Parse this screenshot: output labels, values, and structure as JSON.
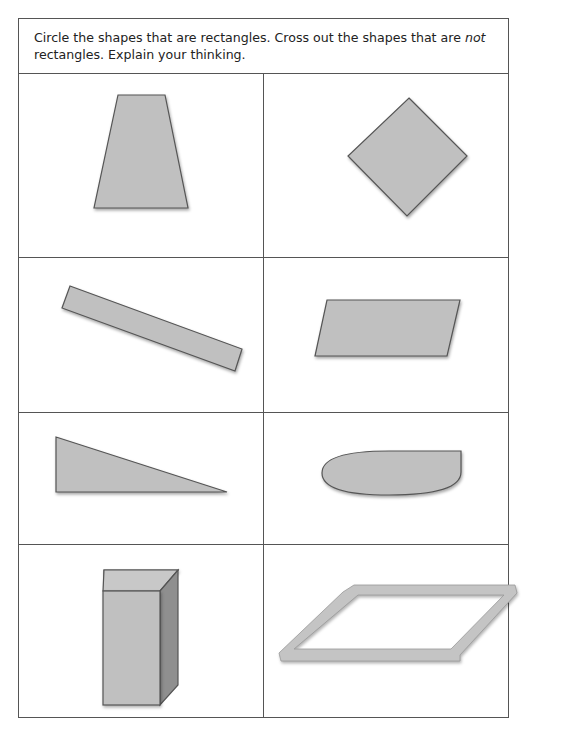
{
  "instructions": {
    "part1": "Circle the shapes that are rectangles. Cross out the shapes that are ",
    "emphasis": "not",
    "part2": " rectangles. Explain your thinking."
  },
  "shapes": [
    {
      "name": "trapezoid",
      "row": 1,
      "col": 1
    },
    {
      "name": "tilted-square",
      "row": 1,
      "col": 2
    },
    {
      "name": "tilted-long-rectangle",
      "row": 2,
      "col": 1
    },
    {
      "name": "parallelogram",
      "row": 2,
      "col": 2
    },
    {
      "name": "right-triangle",
      "row": 3,
      "col": 1
    },
    {
      "name": "half-ellipse",
      "row": 3,
      "col": 2
    },
    {
      "name": "rectangular-prism",
      "row": 4,
      "col": 1
    },
    {
      "name": "parallelogram-frame",
      "row": 4,
      "col": 2
    }
  ],
  "colors": {
    "shape_fill": "#c0c0c0",
    "shape_stroke": "#555555",
    "border": "#555555"
  }
}
